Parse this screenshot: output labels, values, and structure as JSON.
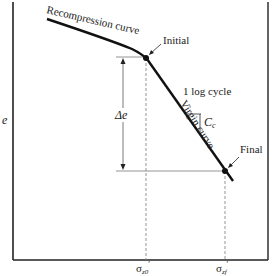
{
  "diagram": {
    "type": "e-log-sigma consolidation curve",
    "y_axis_label": "e",
    "x_ticks": [
      {
        "label": "σz0′",
        "main": "σ",
        "sub": "z0",
        "prime": "′"
      },
      {
        "label": "σzf′",
        "main": "σ",
        "sub": "zf",
        "prime": "′"
      }
    ],
    "curves": {
      "recompression": "Recompression curve",
      "virgin": "Virgin curve"
    },
    "points": {
      "initial": "Initial",
      "final": "Final"
    },
    "annotations": {
      "delta_e": "Δe",
      "log_cycle": "1 log cycle",
      "cc": "C",
      "cc_sub": "c"
    },
    "colors": {
      "curve": "#111111",
      "axis": "#222222",
      "guide": "#888888"
    }
  }
}
